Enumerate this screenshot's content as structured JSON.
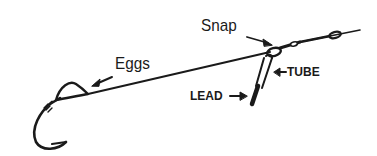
{
  "diagram": {
    "labels": {
      "eggs": "Eggs",
      "snap": "Snap",
      "tube": "TUBE",
      "lead": "LEAD"
    },
    "colors": {
      "ink": "#1a1a1a",
      "background": "#ffffff"
    }
  }
}
